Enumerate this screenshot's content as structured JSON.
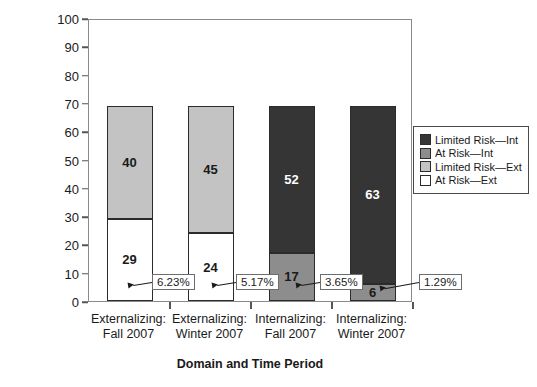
{
  "chart_data": {
    "type": "bar",
    "title": "",
    "subtitle": "",
    "xlabel": "Domain and Time Period",
    "ylabel": "Number of Students",
    "ylim": [
      0,
      100
    ],
    "ytick_step": 10,
    "yticks": [
      "100",
      "90",
      "80",
      "70",
      "60",
      "50",
      "40",
      "30",
      "20",
      "10",
      "0"
    ],
    "grid": false,
    "stacked": true,
    "legend_position": "right",
    "categories": [
      "Externalizing: Fall 2007",
      "Externalizing: Winter 2007",
      "Internalizing: Fall 2007",
      "Internalizing: Winter 2007"
    ],
    "category_lines": [
      [
        "Externalizing:",
        "Fall 2007"
      ],
      [
        "Externalizing:",
        "Winter 2007"
      ],
      [
        "Internalizing:",
        "Fall 2007"
      ],
      [
        "Internalizing:",
        "Winter 2007"
      ]
    ],
    "series": [
      {
        "name": "At Risk—Ext",
        "color": "#ffffff",
        "values": [
          29,
          24,
          null,
          null
        ]
      },
      {
        "name": "Limited Risk—Ext",
        "color": "#c3c3c3",
        "values": [
          40,
          45,
          null,
          null
        ]
      },
      {
        "name": "At Risk—Int",
        "color": "#8d8d8d",
        "values": [
          null,
          null,
          17,
          6
        ]
      },
      {
        "name": "Limited Risk—Int",
        "color": "#353535",
        "values": [
          null,
          null,
          52,
          63
        ]
      }
    ],
    "bar_totals": [
      69,
      69,
      69,
      69
    ],
    "annotations": [
      {
        "text": "6.23%",
        "points_to": "Externalizing: Fall 2007 / At Risk—Ext"
      },
      {
        "text": "5.17%",
        "points_to": "Externalizing: Winter 2007 / At Risk—Ext"
      },
      {
        "text": "3.65%",
        "points_to": "Internalizing: Fall 2007 / At Risk—Int"
      },
      {
        "text": "1.29%",
        "points_to": "Internalizing: Winter 2007 / At Risk—Int"
      }
    ]
  },
  "legend": {
    "items": [
      {
        "label": "Limited Risk—Int",
        "color": "#353535"
      },
      {
        "label": "At Risk—Int",
        "color": "#8d8d8d"
      },
      {
        "label": "Limited Risk—Ext",
        "color": "#c3c3c3"
      },
      {
        "label": "At Risk—Ext",
        "color": "#ffffff"
      }
    ]
  },
  "bars": [
    {
      "top": {
        "value": "40",
        "color": "#c3c3c3",
        "text_color": "#1a1a1a"
      },
      "bottom": {
        "value": "29",
        "color": "#ffffff",
        "text_color": "#1a1a1a"
      }
    },
    {
      "top": {
        "value": "45",
        "color": "#c3c3c3",
        "text_color": "#1a1a1a"
      },
      "bottom": {
        "value": "24",
        "color": "#ffffff",
        "text_color": "#1a1a1a"
      }
    },
    {
      "top": {
        "value": "52",
        "color": "#353535",
        "text_color": "#ffffff"
      },
      "bottom": {
        "value": "17",
        "color": "#8d8d8d",
        "text_color": "#1a1a1a"
      }
    },
    {
      "top": {
        "value": "63",
        "color": "#353535",
        "text_color": "#ffffff"
      },
      "bottom": {
        "value": "6",
        "color": "#8d8d8d",
        "text_color": "#1a1a1a"
      }
    }
  ],
  "callouts": [
    {
      "text": "6.23%"
    },
    {
      "text": "5.17%"
    },
    {
      "text": "3.65%"
    },
    {
      "text": "1.29%"
    }
  ],
  "axis": {
    "y_title": "Number of Students",
    "x_title": "Domain and Time Period",
    "yticks": [
      "100",
      "90",
      "80",
      "70",
      "60",
      "50",
      "40",
      "30",
      "20",
      "10",
      "0"
    ]
  }
}
